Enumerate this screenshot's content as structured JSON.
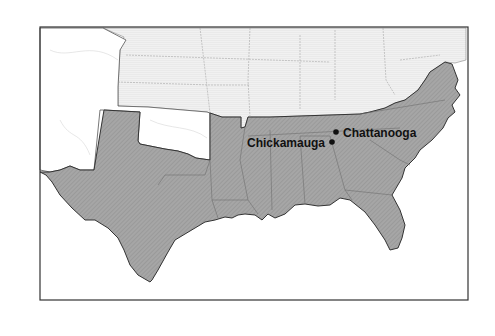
{
  "map": {
    "colors": {
      "confederate_fill": "#a9a9a9",
      "union_fill": "#eeeeee",
      "territory_fill": "#ffffff",
      "border": "#333333",
      "state_line": "#777777",
      "water": "#ffffff"
    },
    "places": [
      {
        "name": "Chattanooga",
        "label": "Chattanooga"
      },
      {
        "name": "Chickamauga",
        "label": "Chickamauga"
      }
    ],
    "legend_regions": [
      "Confederate states",
      "Union states",
      "Territories"
    ]
  }
}
